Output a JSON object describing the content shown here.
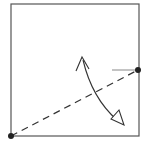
{
  "diagram": {
    "colors": {
      "stroke": "#333333",
      "square": "#555555",
      "tick": "#888888",
      "background": "#ffffff"
    },
    "square": {
      "x": 11,
      "y": 4,
      "w": 128,
      "h": 132
    },
    "points": [
      {
        "name": "bottom-left-corner",
        "x": 11,
        "y": 136
      },
      {
        "name": "right-edge-point",
        "x": 138,
        "y": 70
      }
    ],
    "tick": {
      "x1": 112,
      "y1": 70,
      "x2": 138,
      "y2": 70
    },
    "arrow": {
      "start_x": 82,
      "start_y": 58,
      "end_x": 122,
      "end_y": 124
    }
  }
}
